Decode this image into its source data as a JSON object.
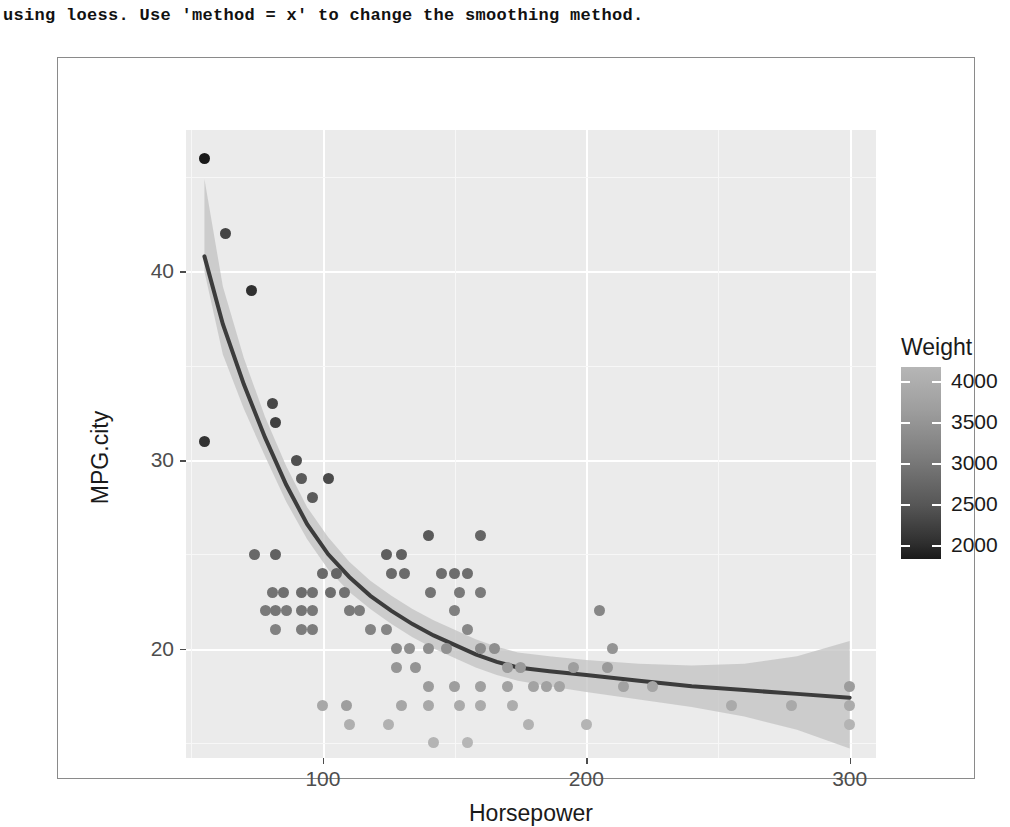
{
  "console": {
    "message": "using loess. Use 'method = x' to change the smoothing method."
  },
  "chart_data": {
    "type": "scatter",
    "title": "",
    "xlabel": "Horsepower",
    "ylabel": "MPG.city",
    "xlim": [
      48,
      310
    ],
    "ylim": [
      14.2,
      47.5
    ],
    "xticks": [
      100,
      200,
      300
    ],
    "yticks": [
      20,
      30,
      40
    ],
    "grid": true,
    "legend": {
      "title": "Weight",
      "position": "right",
      "type": "colorbar-continuous",
      "ticks": [
        4000,
        3500,
        3000,
        2500,
        2000
      ],
      "colors": [
        "#b6b6b6",
        "#1a1a1a"
      ]
    },
    "smooth": {
      "method": "loess",
      "line_color": "#3c3c3c",
      "band_color": "#c2c2c2",
      "note": "loess fit with 95% confidence band"
    },
    "point_color_variable": "Weight",
    "points": [
      {
        "x": 55,
        "y": 46,
        "w": 1695
      },
      {
        "x": 63,
        "y": 42,
        "w": 2350
      },
      {
        "x": 73,
        "y": 39,
        "w": 2045
      },
      {
        "x": 55,
        "y": 31,
        "w": 2085
      },
      {
        "x": 81,
        "y": 33,
        "w": 2390
      },
      {
        "x": 82,
        "y": 32,
        "w": 2285
      },
      {
        "x": 90,
        "y": 30,
        "w": 2530
      },
      {
        "x": 92,
        "y": 29,
        "w": 2690
      },
      {
        "x": 96,
        "y": 28,
        "w": 2710
      },
      {
        "x": 102,
        "y": 29,
        "w": 2440
      },
      {
        "x": 74,
        "y": 25,
        "w": 2920
      },
      {
        "x": 82,
        "y": 25,
        "w": 2805
      },
      {
        "x": 81,
        "y": 23,
        "w": 3085
      },
      {
        "x": 85,
        "y": 23,
        "w": 3020
      },
      {
        "x": 92,
        "y": 23,
        "w": 2970
      },
      {
        "x": 96,
        "y": 23,
        "w": 3055
      },
      {
        "x": 78,
        "y": 22,
        "w": 3200
      },
      {
        "x": 82,
        "y": 22,
        "w": 3120
      },
      {
        "x": 86,
        "y": 22,
        "w": 3180
      },
      {
        "x": 92,
        "y": 22,
        "w": 3115
      },
      {
        "x": 96,
        "y": 22,
        "w": 3160
      },
      {
        "x": 82,
        "y": 21,
        "w": 3295
      },
      {
        "x": 92,
        "y": 21,
        "w": 3240
      },
      {
        "x": 96,
        "y": 21,
        "w": 3225
      },
      {
        "x": 100,
        "y": 24,
        "w": 2930
      },
      {
        "x": 105,
        "y": 24,
        "w": 2865
      },
      {
        "x": 103,
        "y": 23,
        "w": 3005
      },
      {
        "x": 108,
        "y": 23,
        "w": 3060
      },
      {
        "x": 110,
        "y": 22,
        "w": 3195
      },
      {
        "x": 114,
        "y": 22,
        "w": 3230
      },
      {
        "x": 100,
        "y": 17,
        "w": 3890
      },
      {
        "x": 109,
        "y": 17,
        "w": 3755
      },
      {
        "x": 110,
        "y": 16,
        "w": 4020
      },
      {
        "x": 124,
        "y": 25,
        "w": 2775
      },
      {
        "x": 130,
        "y": 25,
        "w": 2810
      },
      {
        "x": 126,
        "y": 24,
        "w": 2940
      },
      {
        "x": 131,
        "y": 24,
        "w": 2965
      },
      {
        "x": 140,
        "y": 26,
        "w": 2690
      },
      {
        "x": 145,
        "y": 24,
        "w": 2990
      },
      {
        "x": 150,
        "y": 24,
        "w": 2985
      },
      {
        "x": 155,
        "y": 24,
        "w": 3010
      },
      {
        "x": 141,
        "y": 23,
        "w": 3105
      },
      {
        "x": 152,
        "y": 23,
        "w": 3180
      },
      {
        "x": 118,
        "y": 21,
        "w": 3340
      },
      {
        "x": 124,
        "y": 21,
        "w": 3365
      },
      {
        "x": 128,
        "y": 20,
        "w": 3480
      },
      {
        "x": 133,
        "y": 20,
        "w": 3520
      },
      {
        "x": 140,
        "y": 20,
        "w": 3510
      },
      {
        "x": 147,
        "y": 20,
        "w": 3545
      },
      {
        "x": 160,
        "y": 26,
        "w": 2865
      },
      {
        "x": 160,
        "y": 23,
        "w": 3190
      },
      {
        "x": 150,
        "y": 22,
        "w": 3280
      },
      {
        "x": 155,
        "y": 21,
        "w": 3400
      },
      {
        "x": 160,
        "y": 20,
        "w": 3490
      },
      {
        "x": 165,
        "y": 20,
        "w": 3520
      },
      {
        "x": 128,
        "y": 19,
        "w": 3635
      },
      {
        "x": 135,
        "y": 19,
        "w": 3600
      },
      {
        "x": 140,
        "y": 18,
        "w": 3720
      },
      {
        "x": 150,
        "y": 18,
        "w": 3760
      },
      {
        "x": 160,
        "y": 18,
        "w": 3790
      },
      {
        "x": 170,
        "y": 18,
        "w": 3820
      },
      {
        "x": 130,
        "y": 17,
        "w": 3880
      },
      {
        "x": 140,
        "y": 17,
        "w": 3910
      },
      {
        "x": 152,
        "y": 17,
        "w": 3945
      },
      {
        "x": 160,
        "y": 17,
        "w": 3960
      },
      {
        "x": 125,
        "y": 16,
        "w": 4050
      },
      {
        "x": 142,
        "y": 15,
        "w": 4100
      },
      {
        "x": 155,
        "y": 15,
        "w": 4130
      },
      {
        "x": 170,
        "y": 19,
        "w": 3705
      },
      {
        "x": 175,
        "y": 19,
        "w": 3680
      },
      {
        "x": 180,
        "y": 18,
        "w": 3840
      },
      {
        "x": 185,
        "y": 18,
        "w": 3800
      },
      {
        "x": 190,
        "y": 18,
        "w": 3855
      },
      {
        "x": 172,
        "y": 17,
        "w": 3985
      },
      {
        "x": 178,
        "y": 16,
        "w": 4075
      },
      {
        "x": 200,
        "y": 16,
        "w": 4100
      },
      {
        "x": 195,
        "y": 19,
        "w": 3760
      },
      {
        "x": 205,
        "y": 22,
        "w": 3380
      },
      {
        "x": 208,
        "y": 19,
        "w": 3690
      },
      {
        "x": 210,
        "y": 20,
        "w": 3595
      },
      {
        "x": 214,
        "y": 18,
        "w": 3820
      },
      {
        "x": 225,
        "y": 18,
        "w": 3870
      },
      {
        "x": 255,
        "y": 17,
        "w": 3950
      },
      {
        "x": 278,
        "y": 17,
        "w": 3920
      },
      {
        "x": 300,
        "y": 18,
        "w": 3730
      },
      {
        "x": 300,
        "y": 17,
        "w": 3960
      },
      {
        "x": 300,
        "y": 16,
        "w": 4105
      }
    ],
    "loess_line": [
      {
        "x": 55,
        "y": 40.8
      },
      {
        "x": 62,
        "y": 37.2
      },
      {
        "x": 70,
        "y": 34.0
      },
      {
        "x": 78,
        "y": 31.2
      },
      {
        "x": 86,
        "y": 28.7
      },
      {
        "x": 94,
        "y": 26.6
      },
      {
        "x": 102,
        "y": 25.0
      },
      {
        "x": 110,
        "y": 23.8
      },
      {
        "x": 118,
        "y": 22.8
      },
      {
        "x": 126,
        "y": 22.0
      },
      {
        "x": 134,
        "y": 21.3
      },
      {
        "x": 142,
        "y": 20.7
      },
      {
        "x": 150,
        "y": 20.2
      },
      {
        "x": 158,
        "y": 19.7
      },
      {
        "x": 166,
        "y": 19.3
      },
      {
        "x": 174,
        "y": 19.0
      },
      {
        "x": 186,
        "y": 18.8
      },
      {
        "x": 200,
        "y": 18.6
      },
      {
        "x": 220,
        "y": 18.3
      },
      {
        "x": 240,
        "y": 18.0
      },
      {
        "x": 260,
        "y": 17.8
      },
      {
        "x": 280,
        "y": 17.6
      },
      {
        "x": 300,
        "y": 17.4
      }
    ],
    "ci_upper": [
      {
        "x": 55,
        "y": 44.9
      },
      {
        "x": 62,
        "y": 39.2
      },
      {
        "x": 70,
        "y": 35.4
      },
      {
        "x": 78,
        "y": 32.3
      },
      {
        "x": 86,
        "y": 29.7
      },
      {
        "x": 94,
        "y": 27.5
      },
      {
        "x": 102,
        "y": 25.9
      },
      {
        "x": 110,
        "y": 24.6
      },
      {
        "x": 118,
        "y": 23.6
      },
      {
        "x": 126,
        "y": 22.8
      },
      {
        "x": 134,
        "y": 22.1
      },
      {
        "x": 142,
        "y": 21.5
      },
      {
        "x": 150,
        "y": 21.0
      },
      {
        "x": 158,
        "y": 20.5
      },
      {
        "x": 166,
        "y": 20.1
      },
      {
        "x": 174,
        "y": 19.8
      },
      {
        "x": 186,
        "y": 19.6
      },
      {
        "x": 200,
        "y": 19.4
      },
      {
        "x": 220,
        "y": 19.2
      },
      {
        "x": 240,
        "y": 19.1
      },
      {
        "x": 260,
        "y": 19.2
      },
      {
        "x": 280,
        "y": 19.6
      },
      {
        "x": 300,
        "y": 20.4
      }
    ],
    "ci_lower": [
      {
        "x": 55,
        "y": 40.0
      },
      {
        "x": 62,
        "y": 35.6
      },
      {
        "x": 70,
        "y": 32.7
      },
      {
        "x": 78,
        "y": 30.2
      },
      {
        "x": 86,
        "y": 27.8
      },
      {
        "x": 94,
        "y": 25.8
      },
      {
        "x": 102,
        "y": 24.2
      },
      {
        "x": 110,
        "y": 23.0
      },
      {
        "x": 118,
        "y": 22.1
      },
      {
        "x": 126,
        "y": 21.3
      },
      {
        "x": 134,
        "y": 20.6
      },
      {
        "x": 142,
        "y": 20.0
      },
      {
        "x": 150,
        "y": 19.5
      },
      {
        "x": 158,
        "y": 19.0
      },
      {
        "x": 166,
        "y": 18.6
      },
      {
        "x": 174,
        "y": 18.3
      },
      {
        "x": 186,
        "y": 18.0
      },
      {
        "x": 200,
        "y": 17.7
      },
      {
        "x": 220,
        "y": 17.3
      },
      {
        "x": 240,
        "y": 16.9
      },
      {
        "x": 260,
        "y": 16.4
      },
      {
        "x": 280,
        "y": 15.7
      },
      {
        "x": 300,
        "y": 14.7
      }
    ]
  }
}
